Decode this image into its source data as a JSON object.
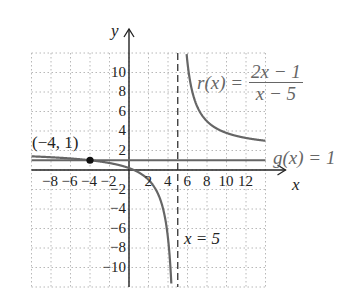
{
  "chart_data": {
    "type": "line",
    "title": "",
    "xlabel": "x",
    "ylabel": "y",
    "xlim": [
      -10,
      14
    ],
    "ylim": [
      -12,
      12
    ],
    "grid": true,
    "x_ticks": [
      "-8",
      "-6",
      "-4",
      "-2",
      "2",
      "4",
      "6",
      "8",
      "10",
      "12"
    ],
    "y_ticks": [
      "10",
      "8",
      "6",
      "4",
      "2",
      "-2",
      "-4",
      "-6",
      "-8",
      "-10"
    ],
    "series": [
      {
        "name": "r(x) = (2x - 1)/(x - 5)",
        "type": "rational",
        "formula": "(2x-1)/(x-5)",
        "color": "#666666"
      },
      {
        "name": "g(x) = 1",
        "type": "horizontal_line",
        "y": 1,
        "color": "#666666"
      }
    ],
    "asymptotes": [
      {
        "type": "vertical",
        "x": 5,
        "label": "x = 5",
        "style": "dashed"
      }
    ],
    "points": [
      {
        "x": -4,
        "y": 1,
        "label": "(−4, 1)"
      }
    ]
  },
  "labels": {
    "y_axis": "y",
    "x_axis": "x",
    "point": "(−4, 1)",
    "r_lhs": "r(x) =",
    "r_num": "2x − 1",
    "r_den": "x − 5",
    "g": "g(x) = 1",
    "asymptote": "x = 5"
  },
  "ticks": {
    "x": [
      "−8",
      "−6",
      "−4",
      "−2",
      "2",
      "4",
      "6",
      "8",
      "10",
      "12"
    ],
    "y": [
      "10",
      "8",
      "6",
      "4",
      "2",
      "−2",
      "−4",
      "−6",
      "−8",
      "−10"
    ]
  }
}
